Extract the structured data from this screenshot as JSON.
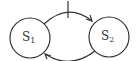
{
  "diagram": {
    "type": "state-transition",
    "stroke_color": "#333333",
    "background": "#ffffff",
    "states": [
      {
        "id": "S1",
        "base": "S",
        "subscript": "1",
        "cx": 30,
        "cy": 38,
        "r": 20
      },
      {
        "id": "S2",
        "base": "S",
        "subscript": "2",
        "cx": 109,
        "cy": 37,
        "r": 20
      }
    ],
    "transitions": [
      {
        "from": "S1",
        "to": "S2",
        "position": "top",
        "has_tick_mark": true
      },
      {
        "from": "S2",
        "to": "S1",
        "position": "bottom",
        "has_tick_mark": false
      }
    ]
  }
}
